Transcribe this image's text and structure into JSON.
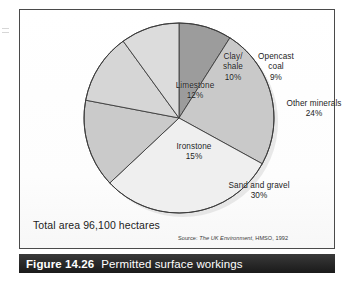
{
  "figure": {
    "caption_number": "Figure 14.26",
    "caption_title": "Permitted surface workings",
    "total_area": "Total area 96,100 hectares",
    "source_prefix": "Source:",
    "source_title": "The UK Environment",
    "source_rest": ", HMSO, 1992"
  },
  "chart_data": {
    "type": "pie",
    "title": "Permitted surface workings",
    "unit": "percent",
    "total_label": "Total area 96,100 hectares",
    "total_hectares": 96100,
    "start_angle_deg": 0,
    "direction": "clockwise",
    "legend": "none (labels placed inside slices)",
    "grid": false,
    "categories": [
      "Opencast coal",
      "Other minerals",
      "Sand and gravel",
      "Ironstone",
      "Limestone",
      "Clay/shale"
    ],
    "values": [
      9,
      24,
      30,
      15,
      12,
      10
    ],
    "slices": [
      {
        "name": "Opencast coal",
        "label": "Opencast\ncoal\n9%",
        "value": 9,
        "value_label": "9%",
        "color": "#9c9c9c"
      },
      {
        "name": "Other minerals",
        "label": "Other minerals\n24%",
        "value": 24,
        "value_label": "24%",
        "color": "#c9c9c9"
      },
      {
        "name": "Sand and gravel",
        "label": "Sand and gravel\n30%",
        "value": 30,
        "value_label": "30%",
        "color": "#efefef"
      },
      {
        "name": "Ironstone",
        "label": "Ironstone\n15%",
        "value": 15,
        "value_label": "15%",
        "color": "#cacaca"
      },
      {
        "name": "Limestone",
        "label": "Limestone\n12%",
        "value": 12,
        "value_label": "12%",
        "color": "#d6d6d6"
      },
      {
        "name": "Clay/shale",
        "label": "Clay/\nshale\n10%",
        "value": 10,
        "value_label": "10%",
        "color": "#dcdcdc"
      }
    ]
  },
  "colors": {
    "caption_bar": "#2b2b2b",
    "caption_text": "#ffffff",
    "panel_border": "#4a4a4a",
    "slice_outline": "#3c3c3c",
    "page_background": "#ffffff"
  }
}
